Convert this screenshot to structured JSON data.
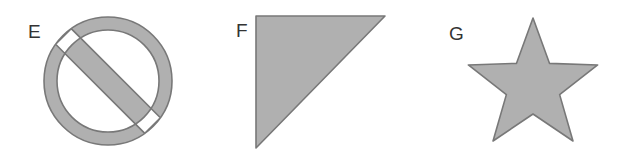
{
  "page": {
    "background_color": "#ffffff",
    "width": 625,
    "height": 162
  },
  "style": {
    "fill_color": "#b0b0b0",
    "stroke_color": "#787878",
    "stroke_width": 1.6,
    "label_color": "#333333"
  },
  "shapes": [
    {
      "label": "E",
      "name": "prohibition-sign",
      "description": "circle with diagonal slash",
      "center_x": 108,
      "center_y": 81,
      "outer_radius": 64,
      "inner_radius": 51,
      "slash_half_width": 11,
      "slash_angle_deg": 45,
      "bounds": {
        "x": 44,
        "y": 17,
        "width": 128,
        "height": 128
      }
    },
    {
      "label": "F",
      "name": "right-triangle",
      "description": "right triangle, right angle at top-left",
      "points": "256,16 385,16 256,148",
      "bounds": {
        "x": 256,
        "y": 16,
        "width": 129,
        "height": 132
      }
    },
    {
      "label": "G",
      "name": "five-pointed-star",
      "description": "five pointed star",
      "center_x": 533,
      "center_y": 86,
      "outer_radius": 68,
      "inner_radius": 28,
      "bounds": {
        "x": 466,
        "y": 18,
        "width": 134,
        "height": 130
      }
    }
  ]
}
